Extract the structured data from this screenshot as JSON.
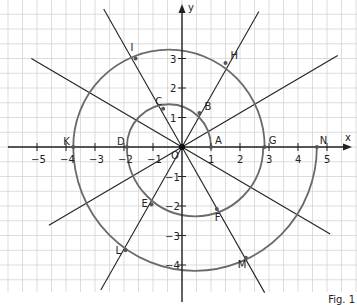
{
  "figure": {
    "caption": "Fig. 1",
    "axes": {
      "x_label": "x",
      "y_label": "y",
      "origin_label": "O",
      "x_ticks": [
        "−5",
        "−4",
        "−3",
        "−2",
        "−1",
        "1",
        "2",
        "3",
        "4",
        "5"
      ],
      "y_ticks": [
        "3",
        "2",
        "1",
        "−1",
        "−2",
        "−3",
        "−4"
      ]
    },
    "rays_degrees": [
      0,
      30,
      60,
      120,
      150,
      210,
      240,
      300,
      330
    ],
    "spiral_arcs": [
      {
        "from": "A",
        "to": "D",
        "half": "upper",
        "center_x": -0.45,
        "radius": 1.45
      },
      {
        "from": "D",
        "to": "G",
        "half": "lower",
        "center_x": 0.45,
        "radius": 2.35
      },
      {
        "from": "G",
        "to": "K",
        "half": "upper",
        "center_x": -0.45,
        "radius": 3.3
      },
      {
        "from": "K",
        "to": "N",
        "half": "lower",
        "center_x": 0.45,
        "radius": 4.2
      }
    ],
    "points": [
      {
        "name": "A",
        "x": 1.0,
        "y": 0
      },
      {
        "name": "B",
        "x": 0.6,
        "y": 1.15
      },
      {
        "name": "C",
        "x": -0.65,
        "y": 1.3
      },
      {
        "name": "D",
        "x": -1.9,
        "y": 0
      },
      {
        "name": "E",
        "x": -1.05,
        "y": -1.95
      },
      {
        "name": "F",
        "x": 1.2,
        "y": -2.1
      },
      {
        "name": "G",
        "x": 2.85,
        "y": 0
      },
      {
        "name": "H",
        "x": 1.5,
        "y": 2.85
      },
      {
        "name": "I",
        "x": -1.6,
        "y": 3.0
      },
      {
        "name": "K",
        "x": -3.75,
        "y": 0
      },
      {
        "name": "L",
        "x": -1.95,
        "y": -3.5
      },
      {
        "name": "M",
        "x": 2.2,
        "y": -3.75
      },
      {
        "name": "N",
        "x": 4.65,
        "y": 0
      }
    ]
  }
}
